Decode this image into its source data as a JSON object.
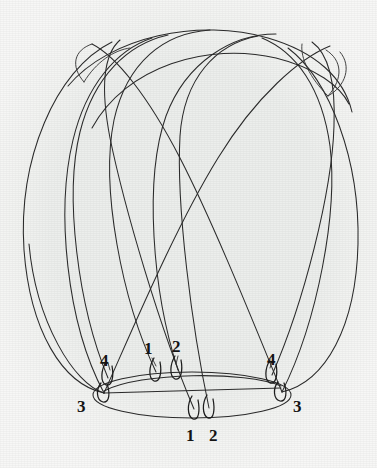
{
  "figure": {
    "caption": "",
    "background_color": "#eceeec",
    "stroke_color": "#2b2b2b",
    "label_color": "#141414",
    "width": 377,
    "height": 468
  },
  "labels": [
    {
      "id": "label-1-upper",
      "text": "1",
      "x": 144,
      "y": 340
    },
    {
      "id": "label-2-upper",
      "text": "2",
      "x": 172,
      "y": 338
    },
    {
      "id": "label-4-left",
      "text": "4",
      "x": 100,
      "y": 352
    },
    {
      "id": "label-4-right",
      "text": "4",
      "x": 267,
      "y": 351
    },
    {
      "id": "label-3-left",
      "text": "3",
      "x": 77,
      "y": 398
    },
    {
      "id": "label-3-right",
      "text": "3",
      "x": 293,
      "y": 398
    },
    {
      "id": "label-1-lower",
      "text": "1",
      "x": 186,
      "y": 427
    },
    {
      "id": "label-2-lower",
      "text": "2",
      "x": 209,
      "y": 427
    }
  ],
  "equator": {
    "name": "equator-ellipse",
    "cx": 192,
    "cy": 395,
    "rx": 99,
    "ry": 23
  },
  "chord": {
    "name": "equator-chord",
    "x1": 104,
    "y1": 393,
    "x2": 281,
    "y2": 388
  },
  "markers": [
    {
      "name": "marker-1-upper",
      "label": "1",
      "x": 156,
      "y": 372
    },
    {
      "name": "marker-2-upper",
      "label": "2",
      "x": 178,
      "y": 370
    },
    {
      "name": "marker-4-left",
      "label": "4",
      "x": 108,
      "y": 378
    },
    {
      "name": "marker-4-right",
      "label": "4",
      "x": 272,
      "y": 375
    },
    {
      "name": "marker-3-left",
      "label": "3",
      "x": 104,
      "y": 394
    },
    {
      "name": "marker-3-right",
      "label": "3",
      "x": 282,
      "y": 392
    },
    {
      "name": "marker-1-lower",
      "label": "1",
      "x": 194,
      "y": 409
    },
    {
      "name": "marker-2-lower",
      "label": "2",
      "x": 209,
      "y": 408
    }
  ],
  "curves": {
    "outer_left": "M 104 393 C 44 382, 21 300, 24 215 C 27 130, 62 62, 110 41 C 150 24, 196 23, 238 30",
    "outer_right": "M 281 390 C 338 380, 360 302, 357 218 C 354 132, 326 68, 286 44",
    "arc_top_long": "M 110 41 C 160 23, 255 25, 305 62 C 330 81, 345 108, 352 140",
    "arc_a": "M 104 393 C 70 330, 63 220, 78 150 C 90 92, 135 57, 196 52 C 258 47, 310 70, 329 95",
    "arc_b": "M 156 372 C 120 300, 100 190, 117 120 C 128 72, 160 46, 205 44 C 270 41, 320 70, 330 96",
    "arc_c": "M 178 370 C 150 290, 140 180, 163 118 C 182 66, 230 44, 272 46 C 312 48, 333 72, 331 96",
    "arc_d": "M 194 409 C 160 330, 122 210, 108 140 C 97 84, 109 56, 128 45",
    "arc_e": "M 209 408 C 190 330, 172 210, 175 140 C 178 80, 215 48, 262 45",
    "arc_f": "M 272 375 C 300 300, 330 190, 336 120 C 340 78, 332 56, 318 47",
    "arc_g": "M 282 392 C 310 320, 334 220, 333 150 C 331 90, 300 55, 262 45",
    "arc_h": "M 108 378 C 88 300, 72 190, 82 130 C 93 70, 130 44, 176 42",
    "arc_i": "M 104 393 C 128 320, 170 215, 212 150 C 252 88, 300 55, 331 46",
    "arc_j": "M 281 390 C 258 320, 220 215, 186 152 C 152 92, 120 58, 96 46"
  }
}
